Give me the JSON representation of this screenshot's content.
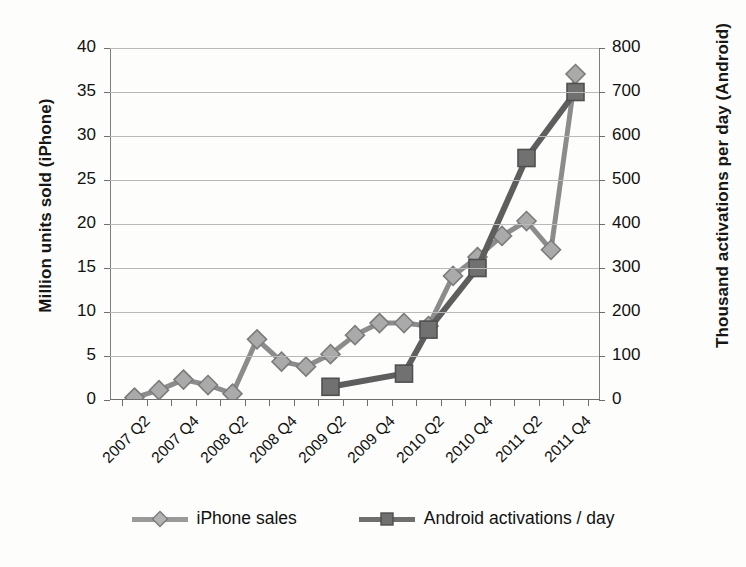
{
  "chart_data": {
    "type": "line",
    "title": "",
    "categories": [
      "2007 Q2",
      "2007 Q3",
      "2007 Q4",
      "2008 Q1",
      "2008 Q2",
      "2008 Q3",
      "2008 Q4",
      "2009 Q1",
      "2009 Q2",
      "2009 Q3",
      "2009 Q4",
      "2010 Q1",
      "2010 Q2",
      "2010 Q3",
      "2010 Q4",
      "2011 Q1",
      "2011 Q2",
      "2011 Q3",
      "2011 Q4"
    ],
    "xtick_labels": [
      "2007 Q2",
      "2007 Q4",
      "2008 Q2",
      "2008 Q4",
      "2009 Q2",
      "2009 Q4",
      "2010 Q2",
      "2010 Q4",
      "2011 Q2",
      "2011 Q4"
    ],
    "xlabel": "",
    "grid": true,
    "legend_position": "bottom",
    "axes": [
      {
        "id": "left",
        "ylabel": "Million units sold (iPhone)",
        "ylim": [
          0,
          40
        ],
        "ytick_labels": [
          "0",
          "5",
          "10",
          "15",
          "20",
          "25",
          "30",
          "35",
          "40"
        ],
        "ytick_values": [
          0,
          5,
          10,
          15,
          20,
          25,
          30,
          35,
          40
        ]
      },
      {
        "id": "right",
        "ylabel": "Thousand activations per day (Android)",
        "ylim": [
          0,
          800
        ],
        "ytick_labels": [
          "0",
          "100",
          "200",
          "300",
          "400",
          "500",
          "600",
          "700",
          "800"
        ],
        "ytick_values": [
          0,
          100,
          200,
          300,
          400,
          500,
          600,
          700,
          800
        ]
      }
    ],
    "series": [
      {
        "name": "iPhone sales",
        "axis": "left",
        "marker": "diamond",
        "color": "#9a9a9a",
        "line_color": "#8c8c8c",
        "x": [
          "2007 Q2",
          "2007 Q3",
          "2007 Q4",
          "2008 Q1",
          "2008 Q2",
          "2008 Q3",
          "2008 Q4",
          "2009 Q1",
          "2009 Q2",
          "2009 Q3",
          "2009 Q4",
          "2010 Q1",
          "2010 Q2",
          "2010 Q3",
          "2010 Q4",
          "2011 Q1",
          "2011 Q2",
          "2011 Q3",
          "2011 Q4"
        ],
        "values": [
          0.27,
          1.12,
          2.32,
          1.7,
          0.72,
          6.89,
          4.36,
          3.79,
          5.21,
          7.37,
          8.74,
          8.75,
          8.4,
          14.1,
          16.24,
          18.65,
          20.34,
          17.07,
          37.04
        ]
      },
      {
        "name": "Android activations / day",
        "axis": "right",
        "marker": "square",
        "color": "#6f6f6f",
        "line_color": "#5e5e5e",
        "x": [
          "2009 Q2",
          "2010 Q1",
          "2010 Q2",
          "2010 Q4",
          "2011 Q2",
          "2011 Q4"
        ],
        "values": [
          30,
          60,
          160,
          300,
          550,
          700
        ]
      }
    ]
  },
  "legend": {
    "items": [
      {
        "label": "iPhone sales",
        "marker": "diamond"
      },
      {
        "label": "Android activations / day",
        "marker": "square"
      }
    ]
  }
}
